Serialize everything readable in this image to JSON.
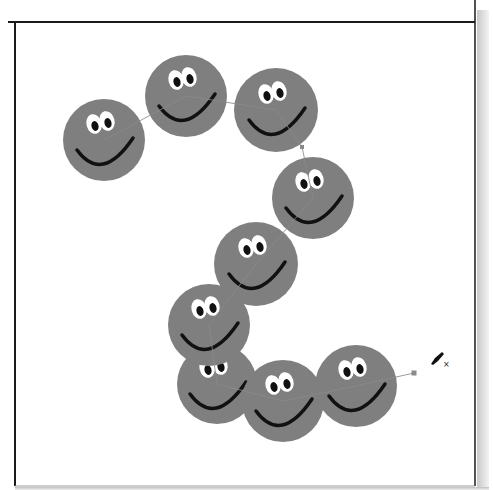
{
  "canvas": {
    "width": 493,
    "height": 490,
    "background": "#ffffff",
    "artboard": {
      "left": 15,
      "top": 22,
      "right": 475,
      "bottom": 486,
      "border_color": "#1a1a1a"
    }
  },
  "colors": {
    "face_fill": "#7f7f7f",
    "smile_stroke": "#111111",
    "eye_white": "#ffffff",
    "pupil": "#111111",
    "path_stroke": "#8a8a8a",
    "anchor_fill": "#8a8a8a"
  },
  "faces": [
    {
      "id": 1,
      "cx": 104,
      "cy": 140,
      "r": 41
    },
    {
      "id": 2,
      "cx": 186,
      "cy": 96,
      "r": 41
    },
    {
      "id": 3,
      "cx": 276,
      "cy": 110,
      "r": 42
    },
    {
      "id": 4,
      "cx": 313,
      "cy": 198,
      "r": 41
    },
    {
      "id": 5,
      "cx": 256,
      "cy": 264,
      "r": 42
    },
    {
      "id": 7,
      "cx": 217,
      "cy": 384,
      "r": 40
    },
    {
      "id": 6,
      "cx": 209,
      "cy": 325,
      "r": 41
    },
    {
      "id": 8,
      "cx": 283,
      "cy": 401,
      "r": 41
    },
    {
      "id": 9,
      "cx": 356,
      "cy": 386,
      "r": 41
    }
  ],
  "path": {
    "points": [
      [
        104,
        140
      ],
      [
        186,
        96
      ],
      [
        276,
        110
      ],
      [
        302,
        147
      ],
      [
        313,
        198
      ],
      [
        256,
        264
      ],
      [
        209,
        325
      ],
      [
        217,
        384
      ],
      [
        283,
        401
      ],
      [
        356,
        386
      ],
      [
        414,
        373
      ]
    ],
    "end_anchor": {
      "x": 414,
      "y": 373
    },
    "mid_anchor": {
      "x": 302,
      "y": 147
    }
  },
  "cursor": {
    "icon": "pen-delete-anchor-icon",
    "x": 431,
    "y": 352,
    "glyph": "✒",
    "badge": "×"
  }
}
